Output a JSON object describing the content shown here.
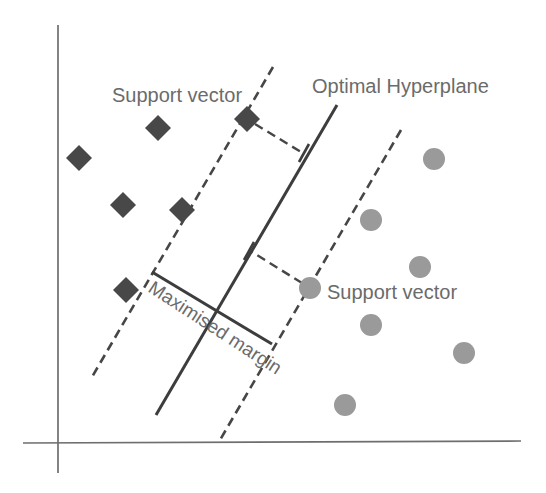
{
  "figure": {
    "kind": "svm-margin-diagram",
    "width": 546,
    "height": 493,
    "background": "#ffffff"
  },
  "colors": {
    "axis": "#6e6e6e",
    "solid_line": "#3d3d3d",
    "dashed_line": "#464646",
    "diamond_fill": "#484848",
    "circle_fill": "#9a9a9a",
    "label_text": "#6b6b6b"
  },
  "labels": [
    {
      "id": "support-vector-top-label",
      "text": "Support vector",
      "x": 112,
      "y": 102,
      "rotate": 0,
      "font_size": 20
    },
    {
      "id": "optimal-hyperplane-label",
      "text": "Optimal Hyperplane",
      "x": 312,
      "y": 93,
      "rotate": 0,
      "font_size": 20
    },
    {
      "id": "support-vector-right-label",
      "text": "Support vector",
      "x": 327,
      "y": 299,
      "rotate": 0,
      "font_size": 20
    },
    {
      "id": "maximised-margin-label",
      "text": "Maximised margin",
      "x": 147,
      "y": 291,
      "rotate": 33,
      "font_size": 19
    }
  ],
  "axes": {
    "y_axis": {
      "x1": 58,
      "y1": 25,
      "x2": 58,
      "y2": 473,
      "width": 1.7
    },
    "x_axis": {
      "x1": 23,
      "y1": 443,
      "x2": 521,
      "y2": 441,
      "width": 1.7
    }
  },
  "lines": [
    {
      "id": "margin-boundary-left-line",
      "style": "dashed",
      "x1": 273,
      "y1": 67,
      "x2": 92,
      "y2": 377,
      "width": 2.6
    },
    {
      "id": "optimal-hyperplane-line",
      "style": "solid",
      "x1": 337,
      "y1": 105,
      "x2": 156,
      "y2": 415,
      "width": 3
    },
    {
      "id": "margin-boundary-right-line",
      "style": "dashed",
      "x1": 401,
      "y1": 130,
      "x2": 220,
      "y2": 440,
      "width": 2.6
    },
    {
      "id": "margin-width-line",
      "style": "solid",
      "x1": 152,
      "y1": 272,
      "x2": 272,
      "y2": 344,
      "width": 3
    },
    {
      "id": "distance-connector-top",
      "style": "dashed",
      "x1": 255,
      "y1": 124,
      "x2": 301,
      "y2": 152,
      "width": 2.4
    },
    {
      "id": "distance-connector-bottom",
      "style": "dashed",
      "x1": 302,
      "y1": 283,
      "x2": 252,
      "y2": 252,
      "width": 2.4
    },
    {
      "id": "connector-tick-top",
      "style": "solid",
      "x1": 309,
      "y1": 144,
      "x2": 299,
      "y2": 162,
      "width": 2.6
    },
    {
      "id": "connector-tick-bottom",
      "style": "solid",
      "x1": 254,
      "y1": 242,
      "x2": 244,
      "y2": 260,
      "width": 2.6
    }
  ],
  "markers": {
    "diamond_half_diagonal": 13,
    "circle_radius": 11,
    "class1_diamonds": [
      {
        "x": 158,
        "y": 128
      },
      {
        "x": 79,
        "y": 158
      },
      {
        "x": 123,
        "y": 205
      },
      {
        "x": 182,
        "y": 210
      },
      {
        "x": 247,
        "y": 119
      },
      {
        "x": 126,
        "y": 290
      }
    ],
    "class2_circles": [
      {
        "x": 434,
        "y": 159
      },
      {
        "x": 371,
        "y": 220
      },
      {
        "x": 420,
        "y": 267
      },
      {
        "x": 310,
        "y": 288
      },
      {
        "x": 371,
        "y": 325
      },
      {
        "x": 464,
        "y": 353
      },
      {
        "x": 345,
        "y": 405
      }
    ]
  },
  "dash_pattern": "9 5.5"
}
